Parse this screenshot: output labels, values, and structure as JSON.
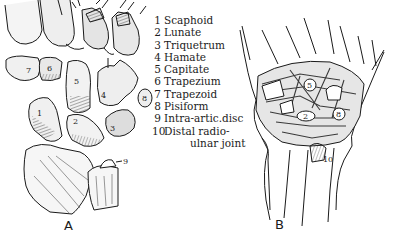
{
  "figure": {
    "panels": [
      {
        "id": "A",
        "label": "A",
        "view": "carpal bones, exploded view"
      },
      {
        "id": "B",
        "label": "B",
        "view": "wrist ligaments, palmar view"
      }
    ]
  },
  "legend": {
    "items": [
      {
        "num": "1",
        "label": "Scaphoid"
      },
      {
        "num": "2",
        "label": "Lunate"
      },
      {
        "num": "3",
        "label": "Triquetrum"
      },
      {
        "num": "4",
        "label": "Hamate"
      },
      {
        "num": "5",
        "label": "Capitate"
      },
      {
        "num": "6",
        "label": "Trapezium"
      },
      {
        "num": "7",
        "label": "Trapezoid"
      },
      {
        "num": "8",
        "label": "Pisiform"
      },
      {
        "num": "9",
        "label": "Intra-artic.disc"
      },
      {
        "num": "10",
        "label": "Distal radio-",
        "continuation": "ulnar joint"
      }
    ]
  },
  "panel_a": {
    "bone_labels": [
      "1",
      "2",
      "3",
      "4",
      "5",
      "6",
      "7",
      "8",
      "9"
    ]
  },
  "panel_b": {
    "bone_labels": [
      "5",
      "2",
      "8",
      "10"
    ]
  },
  "colors": {
    "ink": "#1a1a1a",
    "paper": "#ffffff",
    "shade": "#6a6a6a"
  }
}
